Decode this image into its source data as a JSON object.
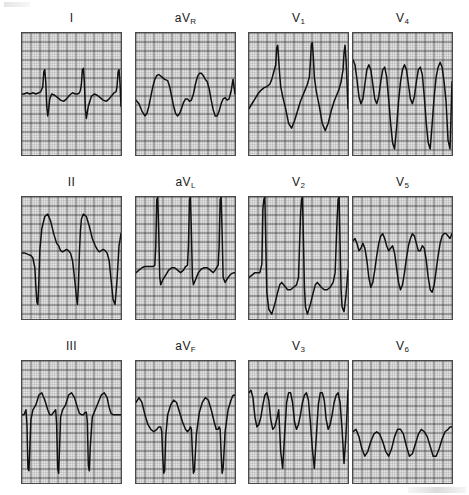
{
  "figure": {
    "kind": "12-lead-electrocardiogram",
    "rows": 3,
    "columns": 4,
    "paper_color": "#fdfdfd",
    "grid_fine_color": "#9a9a9a",
    "grid_bold_color": "#3c3c3c",
    "trace_color": "#111111",
    "border_color": "#4a4a4a",
    "fine_grid_px": 1.8,
    "bold_grid_every": 5
  },
  "chart_data": {
    "type": "line",
    "title": "",
    "xlabel": "",
    "ylabel": "",
    "grid": true,
    "legend": "none",
    "panel_layout": [
      [
        "I",
        "aVR",
        "V1",
        "V4"
      ],
      [
        "II",
        "aVL",
        "V2",
        "V5"
      ],
      [
        "III",
        "aVF",
        "V3",
        "V6"
      ]
    ],
    "series": [
      {
        "name": "I",
        "label_main": "I",
        "label_sub": "",
        "x": [
          0,
          2,
          5,
          8,
          11,
          14,
          17,
          19,
          21,
          22,
          23,
          24,
          25,
          26,
          27,
          28,
          30,
          33,
          36,
          39,
          42,
          45,
          48,
          51,
          54,
          56,
          58,
          59,
          60,
          61,
          62,
          63,
          64,
          65,
          67,
          70,
          73,
          76,
          79,
          82,
          85,
          88,
          91,
          93,
          95,
          96,
          97,
          98,
          99,
          100
        ],
        "y": [
          50,
          50,
          49,
          50,
          49,
          50,
          49,
          48,
          44,
          32,
          30,
          40,
          60,
          68,
          62,
          54,
          50,
          51,
          53,
          55,
          56,
          54,
          51,
          49,
          50,
          50,
          49,
          47,
          42,
          30,
          29,
          40,
          62,
          70,
          60,
          52,
          50,
          51,
          53,
          55,
          56,
          54,
          51,
          49,
          48,
          44,
          32,
          30,
          41,
          60
        ],
        "baseline": 50
      },
      {
        "name": "aVR",
        "label_main": "aV",
        "label_sub": "R",
        "x": [
          0,
          3,
          6,
          9,
          11,
          13,
          15,
          17,
          19,
          21,
          23,
          26,
          29,
          32,
          34,
          36,
          38,
          40,
          42,
          44,
          46,
          48,
          50,
          52,
          54,
          56,
          58,
          60,
          62,
          64,
          66,
          68,
          70,
          72,
          74,
          76,
          78,
          80,
          82,
          84,
          86,
          88,
          90,
          92,
          94,
          96,
          98,
          100
        ],
        "y": [
          55,
          58,
          64,
          68,
          66,
          60,
          52,
          44,
          38,
          35,
          34,
          36,
          38,
          39,
          44,
          52,
          60,
          66,
          68,
          66,
          62,
          57,
          54,
          54,
          56,
          55,
          50,
          42,
          36,
          33,
          33,
          35,
          38,
          40,
          46,
          55,
          63,
          68,
          68,
          64,
          58,
          54,
          53,
          55,
          54,
          48,
          38,
          50
        ],
        "baseline": 50
      },
      {
        "name": "V1",
        "label_main": "V",
        "label_sub": "1",
        "x": [
          0,
          3,
          6,
          9,
          12,
          15,
          18,
          21,
          23,
          25,
          27,
          28,
          29,
          30,
          31,
          32,
          34,
          37,
          40,
          43,
          46,
          49,
          52,
          55,
          57,
          59,
          61,
          62,
          63,
          64,
          65,
          66,
          68,
          71,
          74,
          77,
          80,
          83,
          86,
          89,
          91,
          93,
          95,
          96,
          97,
          98,
          99,
          100
        ],
        "y": [
          62,
          58,
          54,
          50,
          47,
          45,
          44,
          42,
          38,
          32,
          26,
          12,
          10,
          22,
          34,
          44,
          52,
          62,
          74,
          78,
          72,
          64,
          56,
          50,
          46,
          42,
          36,
          24,
          9,
          8,
          20,
          36,
          48,
          60,
          74,
          80,
          74,
          64,
          56,
          50,
          46,
          40,
          30,
          16,
          10,
          22,
          40,
          62
        ],
        "baseline": 52
      },
      {
        "name": "V4",
        "label_main": "V",
        "label_sub": "4",
        "x": [
          0,
          2,
          4,
          6,
          8,
          10,
          12,
          14,
          16,
          18,
          20,
          22,
          24,
          26,
          28,
          30,
          32,
          34,
          36,
          38,
          40,
          42,
          44,
          46,
          48,
          50,
          52,
          54,
          56,
          58,
          60,
          62,
          64,
          66,
          68,
          70,
          72,
          74,
          76,
          78,
          80,
          82,
          84,
          86,
          88,
          90,
          92,
          94,
          96,
          98,
          100
        ],
        "y": [
          22,
          26,
          38,
          52,
          58,
          54,
          42,
          30,
          26,
          30,
          42,
          54,
          58,
          52,
          40,
          30,
          28,
          36,
          54,
          74,
          90,
          95,
          78,
          56,
          40,
          30,
          26,
          30,
          42,
          54,
          58,
          52,
          40,
          30,
          28,
          34,
          52,
          74,
          90,
          95,
          74,
          52,
          36,
          28,
          24,
          28,
          40,
          56,
          88,
          95,
          40
        ],
        "baseline": 50
      },
      {
        "name": "II",
        "label_main": "II",
        "label_sub": "",
        "x": [
          0,
          3,
          6,
          9,
          11,
          13,
          14,
          15,
          16,
          17,
          18,
          20,
          23,
          26,
          29,
          32,
          35,
          37,
          39,
          41,
          43,
          45,
          47,
          49,
          51,
          53,
          55,
          56,
          57,
          58,
          59,
          60,
          62,
          65,
          68,
          71,
          74,
          76,
          78,
          80,
          82,
          84,
          86,
          88,
          90,
          92,
          94,
          96,
          98,
          100
        ],
        "y": [
          46,
          46,
          47,
          48,
          50,
          58,
          74,
          86,
          88,
          70,
          44,
          26,
          16,
          14,
          20,
          30,
          38,
          40,
          44,
          45,
          44,
          43,
          44,
          46,
          52,
          66,
          82,
          88,
          72,
          46,
          28,
          18,
          14,
          16,
          24,
          34,
          40,
          43,
          45,
          44,
          43,
          44,
          46,
          52,
          68,
          84,
          88,
          68,
          40,
          30
        ],
        "baseline": 44
      },
      {
        "name": "aVL",
        "label_main": "aV",
        "label_sub": "L",
        "x": [
          0,
          3,
          6,
          9,
          12,
          15,
          17,
          19,
          20,
          21,
          22,
          23,
          24,
          25,
          27,
          30,
          33,
          36,
          39,
          42,
          45,
          48,
          50,
          52,
          53,
          54,
          55,
          56,
          57,
          58,
          60,
          63,
          66,
          69,
          72,
          75,
          78,
          80,
          82,
          83,
          84,
          85,
          86,
          87,
          88,
          90,
          93,
          96,
          99,
          100
        ],
        "y": [
          62,
          60,
          58,
          57,
          57,
          57,
          57,
          56,
          40,
          2,
          0,
          30,
          66,
          72,
          68,
          64,
          60,
          58,
          58,
          60,
          62,
          60,
          57,
          56,
          40,
          2,
          0,
          30,
          66,
          72,
          68,
          62,
          59,
          58,
          58,
          60,
          62,
          60,
          57,
          56,
          40,
          2,
          0,
          30,
          66,
          70,
          66,
          63,
          62,
          62
        ],
        "baseline": 60
      },
      {
        "name": "V2",
        "label_main": "V",
        "label_sub": "2",
        "x": [
          0,
          3,
          6,
          9,
          11,
          13,
          14,
          15,
          16,
          17,
          18,
          20,
          23,
          26,
          29,
          31,
          33,
          35,
          37,
          39,
          42,
          45,
          48,
          50,
          52,
          53,
          54,
          55,
          56,
          57,
          59,
          62,
          65,
          67,
          69,
          71,
          73,
          76,
          79,
          82,
          85,
          87,
          89,
          90,
          91,
          92,
          93,
          94,
          96,
          98,
          100
        ],
        "y": [
          66,
          64,
          62,
          62,
          62,
          55,
          10,
          2,
          0,
          40,
          78,
          92,
          96,
          88,
          78,
          72,
          70,
          72,
          74,
          76,
          76,
          74,
          72,
          66,
          16,
          2,
          0,
          36,
          74,
          90,
          96,
          88,
          78,
          72,
          70,
          72,
          74,
          76,
          76,
          74,
          70,
          62,
          18,
          2,
          0,
          38,
          76,
          90,
          94,
          80,
          60
        ],
        "baseline": 70
      },
      {
        "name": "V5",
        "label_main": "V",
        "label_sub": "5",
        "x": [
          0,
          2,
          4,
          6,
          8,
          10,
          12,
          14,
          16,
          18,
          20,
          22,
          24,
          26,
          28,
          30,
          32,
          34,
          36,
          38,
          40,
          42,
          44,
          46,
          48,
          50,
          52,
          54,
          56,
          58,
          60,
          62,
          64,
          66,
          68,
          70,
          72,
          74,
          76,
          78,
          80,
          82,
          84,
          86,
          88,
          90,
          92,
          94,
          96,
          98,
          100
        ],
        "y": [
          36,
          34,
          38,
          44,
          42,
          38,
          42,
          52,
          66,
          74,
          70,
          60,
          48,
          38,
          32,
          30,
          34,
          40,
          44,
          42,
          40,
          46,
          58,
          70,
          76,
          72,
          62,
          50,
          40,
          34,
          30,
          32,
          38,
          44,
          44,
          40,
          42,
          52,
          66,
          76,
          78,
          72,
          60,
          48,
          38,
          32,
          30,
          30,
          32,
          34,
          30
        ],
        "baseline": 48
      },
      {
        "name": "III",
        "label_main": "III",
        "label_sub": "",
        "x": [
          0,
          2,
          4,
          5,
          6,
          7,
          8,
          9,
          11,
          14,
          17,
          20,
          23,
          26,
          28,
          30,
          32,
          34,
          35,
          36,
          37,
          38,
          39,
          41,
          44,
          47,
          50,
          53,
          56,
          58,
          60,
          62,
          64,
          65,
          66,
          67,
          68,
          69,
          71,
          74,
          77,
          80,
          83,
          86,
          88,
          90,
          92,
          94,
          96,
          98,
          100
        ],
        "y": [
          44,
          44,
          40,
          52,
          88,
          90,
          70,
          48,
          40,
          36,
          28,
          26,
          32,
          40,
          44,
          44,
          42,
          40,
          52,
          88,
          92,
          70,
          46,
          40,
          36,
          28,
          26,
          30,
          38,
          43,
          44,
          44,
          42,
          42,
          50,
          86,
          90,
          70,
          46,
          40,
          34,
          28,
          26,
          30,
          38,
          43,
          44,
          44,
          44,
          44,
          44
        ],
        "baseline": 44
      },
      {
        "name": "aVF",
        "label_main": "aV",
        "label_sub": "F",
        "x": [
          0,
          3,
          6,
          9,
          12,
          15,
          18,
          21,
          23,
          25,
          26,
          27,
          28,
          29,
          30,
          32,
          35,
          38,
          41,
          44,
          47,
          50,
          52,
          54,
          55,
          56,
          57,
          58,
          59,
          61,
          64,
          67,
          70,
          73,
          76,
          79,
          81,
          83,
          84,
          85,
          86,
          87,
          88,
          90,
          93,
          96,
          98,
          100
        ],
        "y": [
          34,
          30,
          34,
          44,
          52,
          56,
          58,
          56,
          54,
          54,
          58,
          78,
          92,
          90,
          62,
          44,
          36,
          32,
          34,
          42,
          50,
          56,
          58,
          56,
          54,
          56,
          76,
          92,
          90,
          60,
          42,
          34,
          30,
          32,
          40,
          50,
          56,
          56,
          54,
          56,
          76,
          92,
          88,
          58,
          40,
          32,
          28,
          28
        ],
        "baseline": 48
      },
      {
        "name": "V3",
        "label_main": "V",
        "label_sub": "3",
        "x": [
          0,
          2,
          4,
          6,
          8,
          10,
          12,
          14,
          16,
          18,
          20,
          22,
          24,
          26,
          28,
          30,
          32,
          34,
          36,
          38,
          40,
          42,
          44,
          46,
          48,
          50,
          52,
          54,
          56,
          58,
          60,
          62,
          64,
          66,
          68,
          70,
          72,
          74,
          76,
          78,
          80,
          82,
          84,
          86,
          88,
          90,
          92,
          94,
          96,
          98,
          100
        ],
        "y": [
          26,
          24,
          30,
          46,
          54,
          52,
          46,
          36,
          28,
          26,
          32,
          48,
          56,
          54,
          48,
          40,
          74,
          88,
          60,
          34,
          26,
          26,
          34,
          50,
          56,
          52,
          44,
          34,
          28,
          26,
          32,
          50,
          72,
          88,
          62,
          36,
          26,
          26,
          32,
          48,
          56,
          52,
          44,
          34,
          28,
          26,
          34,
          56,
          84,
          60,
          24
        ],
        "baseline": 48
      },
      {
        "name": "V6",
        "label_main": "V",
        "label_sub": "6",
        "x": [
          0,
          3,
          6,
          9,
          12,
          15,
          18,
          21,
          24,
          27,
          30,
          33,
          36,
          39,
          42,
          45,
          48,
          51,
          54,
          57,
          60,
          63,
          66,
          69,
          72,
          75,
          78,
          81,
          84,
          87,
          90,
          93,
          96,
          98,
          100
        ],
        "y": [
          58,
          56,
          62,
          72,
          78,
          74,
          66,
          60,
          58,
          60,
          66,
          74,
          78,
          72,
          62,
          56,
          56,
          60,
          70,
          78,
          76,
          68,
          60,
          56,
          58,
          62,
          70,
          78,
          78,
          72,
          64,
          58,
          56,
          54,
          54
        ],
        "baseline": 66
      }
    ]
  },
  "labels": {
    "I": "I",
    "II": "II",
    "III": "III",
    "aVR_main": "aV",
    "aVR_sub": "R",
    "aVL_main": "aV",
    "aVL_sub": "L",
    "aVF_main": "aV",
    "aVF_sub": "F",
    "V1_main": "V",
    "V1_sub": "1",
    "V2_main": "V",
    "V2_sub": "2",
    "V3_main": "V",
    "V3_sub": "3",
    "V4_main": "V",
    "V4_sub": "4",
    "V5_main": "V",
    "V5_sub": "5",
    "V6_main": "V",
    "V6_sub": "6"
  }
}
